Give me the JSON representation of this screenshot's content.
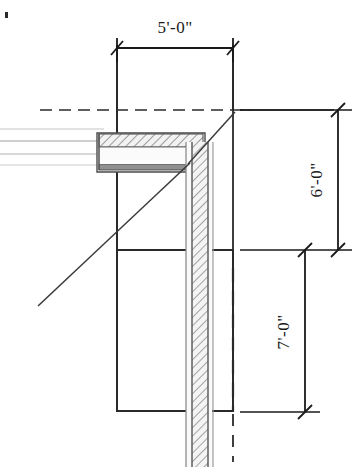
{
  "drawing": {
    "title": "Wall and Beam Section Detail",
    "type": "architectural-section",
    "background_color": "#ffffff",
    "line_color": "#1a1a1a",
    "hatch_color": "#6b6b6b",
    "ghost_color": "#c9c9c9",
    "dimensions": [
      {
        "id": "width-top",
        "label": "5'-0\"",
        "orientation": "horizontal",
        "position": "top",
        "terminator": "architectural-tick"
      },
      {
        "id": "height-upper",
        "label": "6'-0\"",
        "orientation": "vertical",
        "position": "right-upper",
        "terminator": "architectural-tick"
      },
      {
        "id": "height-lower",
        "label": "7'-0\"",
        "orientation": "vertical",
        "position": "right-lower",
        "terminator": "architectural-tick"
      }
    ],
    "elements": [
      {
        "id": "upper-opening-box",
        "name": "upper-opening-outline"
      },
      {
        "id": "lower-opening-box",
        "name": "lower-opening-outline"
      },
      {
        "id": "horizontal-beam",
        "name": "hatched-horizontal-beam"
      },
      {
        "id": "vertical-wall",
        "name": "hatched-vertical-wall"
      },
      {
        "id": "centerline-horizontal",
        "name": "horizontal-centerline"
      },
      {
        "id": "centerline-vertical",
        "name": "vertical-centerline"
      },
      {
        "id": "leader-diagonal",
        "name": "diagonal-leader-line"
      },
      {
        "id": "ghost-lines",
        "name": "ghosted-extension-lines"
      }
    ],
    "corner_mark": "•"
  }
}
